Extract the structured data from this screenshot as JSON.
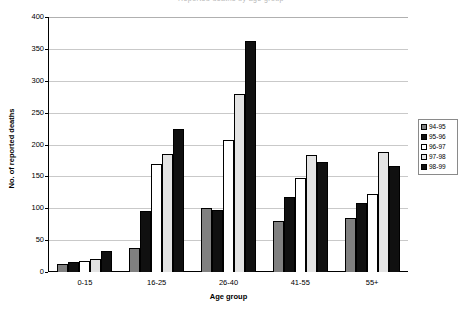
{
  "title_fragment": "Reported deaths by age group",
  "chart_data": {
    "type": "bar",
    "title": "",
    "xlabel": "Age group",
    "ylabel": "No. of reported deaths",
    "ylim": [
      0,
      400
    ],
    "ytick_step": 50,
    "yticks": [
      "0",
      "50",
      "100",
      "150",
      "200",
      "250",
      "300",
      "350",
      "400"
    ],
    "grid": true,
    "legend_position": "right",
    "categories": [
      "0-15",
      "16-25",
      "26-40",
      "41-55",
      "55+"
    ],
    "series": [
      {
        "name": "94-95",
        "color": "#808080",
        "values": [
          12,
          38,
          100,
          80,
          84
        ]
      },
      {
        "name": "95-96",
        "color": "#101010",
        "values": [
          16,
          96,
          98,
          118,
          108
        ]
      },
      {
        "name": "96-97",
        "color": "#ffffff",
        "values": [
          18,
          170,
          207,
          147,
          122
        ]
      },
      {
        "name": "97-98",
        "color": "#e3e3e3",
        "values": [
          20,
          185,
          279,
          184,
          188
        ]
      },
      {
        "name": "98-99",
        "color": "#101010",
        "values": [
          33,
          224,
          363,
          172,
          166
        ]
      }
    ]
  }
}
